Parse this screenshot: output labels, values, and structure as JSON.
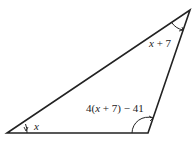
{
  "diagram": {
    "type": "triangle",
    "vertices": {
      "bottom_left": [
        7,
        133
      ],
      "bottom_right": [
        148,
        133
      ],
      "top_right": [
        190,
        10
      ]
    },
    "angles": {
      "bottom_left": {
        "label_var": "x",
        "label_rest": ""
      },
      "top_right": {
        "label_var": "x",
        "label_rest": " + 7"
      },
      "bottom_right": {
        "label_pre": "4(",
        "label_var": "x",
        "label_rest": " + 7) − 41"
      }
    },
    "colors": {
      "stroke": "#222222",
      "background": "#ffffff"
    }
  }
}
